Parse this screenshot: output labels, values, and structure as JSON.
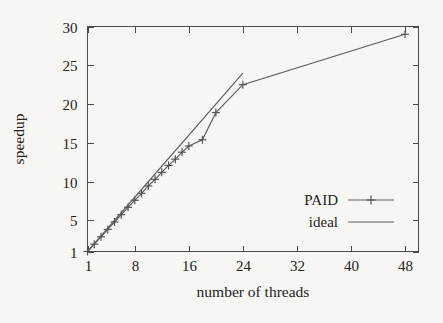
{
  "chart_data": {
    "type": "line",
    "title": "",
    "xlabel": "number of threads",
    "ylabel": "speedup",
    "xlim": [
      1,
      50
    ],
    "ylim": [
      1,
      30
    ],
    "grid": false,
    "legend_position": "inside-bottom-right",
    "xticks": [
      1,
      8,
      16,
      24,
      32,
      40,
      48
    ],
    "xtick_labels": [
      "1",
      "8",
      "16",
      "24",
      "32",
      "40",
      "48"
    ],
    "yticks": [
      1,
      5,
      10,
      15,
      20,
      25,
      30
    ],
    "ytick_labels": [
      "1",
      "5",
      "10",
      "15",
      "20",
      "25",
      "30"
    ],
    "series": [
      {
        "name": "PAID",
        "marker": "plus",
        "x": [
          1,
          2,
          3,
          4,
          5,
          6,
          7,
          8,
          9,
          10,
          11,
          12,
          13,
          14,
          15,
          16,
          18,
          20,
          24,
          48
        ],
        "values": [
          1.0,
          1.95,
          2.9,
          3.85,
          4.8,
          5.75,
          6.7,
          7.6,
          8.5,
          9.45,
          10.3,
          11.2,
          12.1,
          12.9,
          13.8,
          14.6,
          15.4,
          18.9,
          22.5,
          29.0
        ]
      },
      {
        "name": "ideal",
        "marker": "none",
        "x": [
          1,
          24
        ],
        "values": [
          1.0,
          24.0
        ]
      }
    ]
  },
  "legend": {
    "entries": [
      {
        "label": "PAID"
      },
      {
        "label": "ideal"
      }
    ]
  },
  "axes": {
    "x_title": "number of threads",
    "y_title": "speedup"
  }
}
